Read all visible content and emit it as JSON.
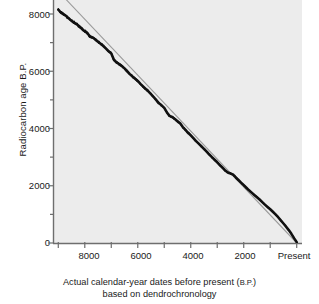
{
  "chart_data": {
    "type": "line",
    "title": "",
    "subtitle": "",
    "xlabel_line1": "Actual calendar-year dates before present (B.P.)",
    "xlabel_line1_main": "Actual calendar-year dates before present (",
    "xlabel_line1_small": "B.P.",
    "xlabel_line1_end": ")",
    "xlabel_line2": "based on dendrochronology",
    "ylabel": "Radiocarbon age B.P.",
    "xlim": [
      9200,
      -200
    ],
    "ylim": [
      0,
      8500
    ],
    "x_axis_inverted": true,
    "grid": false,
    "legend": "none",
    "x_major_ticks": [
      8000,
      6000,
      4000,
      2000,
      0
    ],
    "x_tick_labels": [
      "8000",
      "6000",
      "4000",
      "2000",
      "Present"
    ],
    "x_minor_ticks": [
      9000,
      7000,
      5000,
      3000,
      1000
    ],
    "y_major_ticks": [
      0,
      2000,
      4000,
      6000,
      8000
    ],
    "y_tick_labels": [
      "0",
      "2000",
      "4000",
      "6000",
      "8000"
    ],
    "y_minor_ticks": [
      1000,
      3000,
      5000,
      7000
    ],
    "series": [
      {
        "name": "calibration-curve",
        "style": "thick-black-line",
        "color": "#111111",
        "description": "Radiocarbon age vs. dendrochronological calendar age; radiocarbon ages run progressively younger than true calendar ages before about 2500 B.P.",
        "x": [
          9000,
          8900,
          8800,
          8700,
          8600,
          8500,
          8400,
          8300,
          8200,
          8100,
          8000,
          7900,
          7800,
          7700,
          7600,
          7500,
          7400,
          7300,
          7200,
          7100,
          7000,
          6900,
          6800,
          6700,
          6600,
          6500,
          6400,
          6300,
          6200,
          6100,
          6000,
          5900,
          5800,
          5700,
          5600,
          5500,
          5400,
          5300,
          5200,
          5100,
          5000,
          4900,
          4800,
          4700,
          4600,
          4500,
          4400,
          4300,
          4200,
          4100,
          4000,
          3900,
          3800,
          3700,
          3600,
          3500,
          3400,
          3300,
          3200,
          3100,
          3000,
          2900,
          2800,
          2700,
          2600,
          2500,
          2400,
          2300,
          2200,
          2100,
          2000,
          1900,
          1800,
          1700,
          1600,
          1500,
          1400,
          1300,
          1200,
          1100,
          1000,
          900,
          800,
          700,
          600,
          500,
          400,
          300,
          200,
          100,
          0
        ],
        "y": [
          8150,
          8050,
          7990,
          7930,
          7840,
          7760,
          7700,
          7640,
          7560,
          7470,
          7400,
          7330,
          7210,
          7180,
          7110,
          7030,
          6960,
          6880,
          6790,
          6700,
          6620,
          6400,
          6310,
          6250,
          6180,
          6100,
          6000,
          5900,
          5820,
          5740,
          5660,
          5560,
          5470,
          5380,
          5300,
          5200,
          5100,
          4990,
          4880,
          4810,
          4720,
          4560,
          4440,
          4400,
          4330,
          4250,
          4180,
          4050,
          3950,
          3850,
          3760,
          3660,
          3560,
          3470,
          3380,
          3290,
          3190,
          3090,
          3000,
          2910,
          2820,
          2720,
          2630,
          2530,
          2460,
          2430,
          2390,
          2290,
          2200,
          2110,
          2020,
          1930,
          1840,
          1760,
          1680,
          1600,
          1520,
          1430,
          1340,
          1260,
          1180,
          1090,
          1000,
          900,
          790,
          680,
          570,
          450,
          320,
          170,
          30
        ]
      },
      {
        "name": "one-to-one-reference-line",
        "style": "thin-grey-line",
        "color": "#9a9a9a",
        "description": "Straight diagonal reference line showing where radiocarbon age would equal calendar age",
        "x": [
          8700,
          0
        ],
        "y": [
          8500,
          0
        ]
      }
    ]
  },
  "figure": {
    "plot_background": "#ececec",
    "page_background": "#ffffff",
    "axis_color": "#6e6e6e",
    "curve_color": "#111111",
    "reference_line_color": "#9a9a9a"
  }
}
